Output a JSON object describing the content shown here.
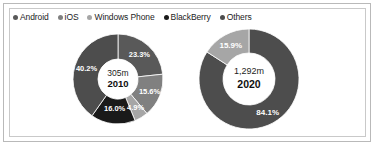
{
  "legend": {
    "items": [
      {
        "label": "Android",
        "color": "#595959"
      },
      {
        "label": "iOS",
        "color": "#808080"
      },
      {
        "label": "Windows Phone",
        "color": "#a6a6a6"
      },
      {
        "label": "BlackBerry",
        "color": "#1a1a1a"
      },
      {
        "label": "Others",
        "color": "#4d4d4d"
      }
    ]
  },
  "chart_data": [
    {
      "type": "pie",
      "title": "2010",
      "center_value": "305m",
      "center_year": "2010",
      "categories": [
        "Android",
        "iOS",
        "Windows Phone",
        "BlackBerry",
        "Others"
      ],
      "values": [
        23.3,
        15.6,
        4.9,
        16.0,
        40.2
      ],
      "labels": [
        "23.3%",
        "15.6%",
        "4.9%",
        "16.0%",
        "40.2%"
      ],
      "colors": [
        "#595959",
        "#808080",
        "#a6a6a6",
        "#1a1a1a",
        "#4d4d4d"
      ],
      "unit": "%",
      "legend_position": "top-left",
      "grid": false
    },
    {
      "type": "pie",
      "title": "2020",
      "center_value": "1,292m",
      "center_year": "2020",
      "categories": [
        "Android",
        "Others"
      ],
      "values": [
        84.1,
        15.9
      ],
      "labels": [
        "84.1%",
        "15.9%"
      ],
      "colors": [
        "#4d4d4d",
        "#a6a6a6"
      ],
      "unit": "%",
      "legend_position": "top-left",
      "grid": false
    }
  ]
}
